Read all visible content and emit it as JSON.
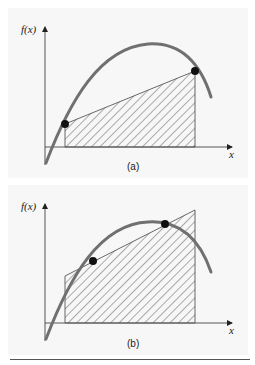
{
  "figure": {
    "panels": [
      {
        "id": "a",
        "label": "(a)",
        "y_axis_label": "f(x)",
        "x_axis_label": "x",
        "description": "Trapezoidal approximation using endpoints on the curve",
        "curve_color": "#707070",
        "hatch_color": "#333333",
        "point_color": "#111111"
      },
      {
        "id": "b",
        "label": "(b)",
        "y_axis_label": "f(x)",
        "x_axis_label": "x",
        "description": "Trapezoid through two interior points on the curve, extended to interval ends",
        "curve_color": "#707070",
        "hatch_color": "#333333",
        "point_color": "#111111"
      }
    ],
    "background_color": "#f7f7f7"
  }
}
